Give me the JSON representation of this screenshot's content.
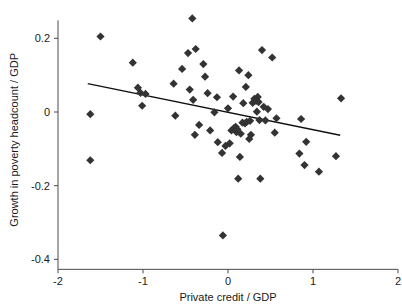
{
  "chart_data": {
    "type": "scatter",
    "title": "",
    "xlabel": "Private credit / GDP",
    "ylabel": "Growth in poverty headcount / GDP",
    "xlim": [
      -2,
      2
    ],
    "ylim": [
      -0.4,
      0.27
    ],
    "xticks": [
      -2,
      -1,
      0,
      1,
      2
    ],
    "xticklabels": [
      "-2",
      "-1",
      "0",
      "1",
      "2"
    ],
    "yticks": [
      0.2,
      0,
      -0.2,
      -0.4
    ],
    "yticklabels": [
      "0.2",
      "0",
      "-0.2",
      "-0.4"
    ],
    "grid": false,
    "legend": null,
    "marker": "diamond",
    "marker_color": "#333333",
    "points": [
      [
        -1.62,
        -0.006
      ],
      [
        -1.62,
        -0.131
      ],
      [
        -1.5,
        0.205
      ],
      [
        -1.12,
        0.134
      ],
      [
        -1.06,
        0.066
      ],
      [
        -1.03,
        0.052
      ],
      [
        -1.01,
        0.017
      ],
      [
        -0.97,
        0.049
      ],
      [
        -0.64,
        0.077
      ],
      [
        -0.62,
        -0.01
      ],
      [
        -0.54,
        0.117
      ],
      [
        -0.47,
        0.16
      ],
      [
        -0.45,
        0.061
      ],
      [
        -0.42,
        0.254
      ],
      [
        -0.41,
        0.033
      ],
      [
        -0.39,
        -0.062
      ],
      [
        -0.38,
        0.171
      ],
      [
        -0.34,
        -0.035
      ],
      [
        -0.29,
        0.13
      ],
      [
        -0.27,
        0.096
      ],
      [
        -0.24,
        0.051
      ],
      [
        -0.21,
        -0.05
      ],
      [
        -0.16,
        -0.001
      ],
      [
        -0.13,
        0.04
      ],
      [
        -0.12,
        -0.082
      ],
      [
        -0.07,
        -0.111
      ],
      [
        -0.06,
        -0.335
      ],
      [
        -0.03,
        -0.092
      ],
      [
        0.0,
        0.01
      ],
      [
        0.02,
        -0.085
      ],
      [
        0.04,
        -0.05
      ],
      [
        0.06,
        0.042
      ],
      [
        0.07,
        -0.044
      ],
      [
        0.08,
        -0.048
      ],
      [
        0.09,
        -0.04
      ],
      [
        0.1,
        -0.055
      ],
      [
        0.11,
        -0.047
      ],
      [
        0.12,
        -0.181
      ],
      [
        0.13,
        0.113
      ],
      [
        0.14,
        -0.122
      ],
      [
        0.15,
        -0.059
      ],
      [
        0.17,
        -0.029
      ],
      [
        0.18,
        0.024
      ],
      [
        0.2,
        -0.031
      ],
      [
        0.21,
        0.068
      ],
      [
        0.22,
        -0.027
      ],
      [
        0.24,
        0.1
      ],
      [
        0.25,
        -0.073
      ],
      [
        0.26,
        -0.024
      ],
      [
        0.27,
        -0.062
      ],
      [
        0.29,
        0.025
      ],
      [
        0.31,
        0.036
      ],
      [
        0.33,
        0.03
      ],
      [
        0.34,
        0.001
      ],
      [
        0.35,
        0.041
      ],
      [
        0.36,
        0.027
      ],
      [
        0.37,
        -0.022
      ],
      [
        0.38,
        -0.181
      ],
      [
        0.4,
        0.168
      ],
      [
        0.42,
        0.014
      ],
      [
        0.44,
        -0.023
      ],
      [
        0.47,
        0.008
      ],
      [
        0.52,
        0.148
      ],
      [
        0.55,
        -0.056
      ],
      [
        0.57,
        -0.017
      ],
      [
        0.84,
        -0.113
      ],
      [
        0.86,
        -0.019
      ],
      [
        0.9,
        -0.144
      ],
      [
        0.92,
        -0.081
      ],
      [
        1.07,
        -0.162
      ],
      [
        1.27,
        -0.12
      ],
      [
        1.33,
        0.037
      ]
    ],
    "fit_line": {
      "x_start": -1.65,
      "y_start": 0.077,
      "x_end": 1.32,
      "y_end": -0.063,
      "color": "#111111"
    }
  }
}
